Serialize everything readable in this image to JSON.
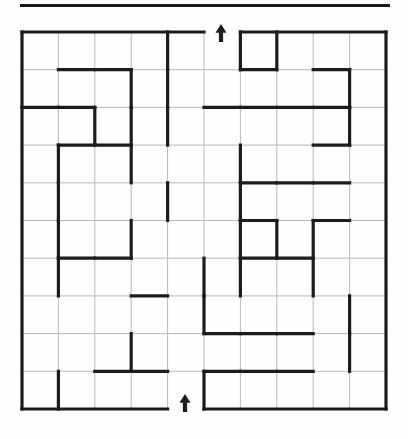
{
  "page": {
    "background_color": "#fefefe",
    "width": 408,
    "height": 439
  },
  "divider": {
    "name": "top-horizontal-rule",
    "color": "#1a1a1a",
    "x": 20,
    "y": 4,
    "width": 370,
    "thickness": 3
  },
  "maze": {
    "label": "10x10 rectangular maze",
    "columns": 10,
    "rows": 10,
    "origin_x": 22,
    "origin_y": 32,
    "cell_width": 36.4,
    "cell_height": 37.7,
    "grid_line_color": "#b9b9b9",
    "grid_line_width": 1,
    "wall_color": "#1c1c1c",
    "wall_width": 3.2,
    "entrance": {
      "name": "maze-entrance",
      "side": "top",
      "column": 5,
      "arrow_glyph": "up-arrow",
      "arrow_x": 221,
      "arrow_y": 24,
      "arrow_height": 18
    },
    "exit": {
      "name": "maze-exit",
      "side": "bottom",
      "column": 4,
      "arrow_glyph": "up-arrow",
      "arrow_x": 185,
      "arrow_y": 394,
      "arrow_height": 18
    },
    "border_segments": {
      "top": [
        [
          0,
          5
        ],
        [
          6,
          10
        ]
      ],
      "bottom": [
        [
          0,
          4
        ],
        [
          5,
          10
        ]
      ],
      "left": [
        [
          0,
          10
        ]
      ],
      "right": [
        [
          0,
          10
        ]
      ]
    },
    "horizontal_walls": [
      {
        "row": 1,
        "col": 1
      },
      {
        "row": 1,
        "col": 2
      },
      {
        "row": 1,
        "col": 8
      },
      {
        "row": 1,
        "col": 6
      },
      {
        "row": 2,
        "col": 0
      },
      {
        "row": 2,
        "col": 1
      },
      {
        "row": 2,
        "col": 5
      },
      {
        "row": 2,
        "col": 6
      },
      {
        "row": 2,
        "col": 7
      },
      {
        "row": 2,
        "col": 8
      },
      {
        "row": 3,
        "col": 1
      },
      {
        "row": 3,
        "col": 2
      },
      {
        "row": 3,
        "col": 8
      },
      {
        "row": 4,
        "col": 6
      },
      {
        "row": 4,
        "col": 7
      },
      {
        "row": 4,
        "col": 8
      },
      {
        "row": 5,
        "col": 6
      },
      {
        "row": 5,
        "col": 8
      },
      {
        "row": 6,
        "col": 1
      },
      {
        "row": 6,
        "col": 2
      },
      {
        "row": 6,
        "col": 6
      },
      {
        "row": 6,
        "col": 7
      },
      {
        "row": 7,
        "col": 3
      },
      {
        "row": 8,
        "col": 5
      },
      {
        "row": 8,
        "col": 6
      },
      {
        "row": 8,
        "col": 7
      },
      {
        "row": 9,
        "col": 2
      },
      {
        "row": 9,
        "col": 3
      },
      {
        "row": 9,
        "col": 5
      },
      {
        "row": 9,
        "col": 6
      },
      {
        "row": 9,
        "col": 7
      }
    ],
    "vertical_walls": [
      {
        "row": 0,
        "col": 4
      },
      {
        "row": 0,
        "col": 6
      },
      {
        "row": 0,
        "col": 7
      },
      {
        "row": 1,
        "col": 3
      },
      {
        "row": 1,
        "col": 4
      },
      {
        "row": 1,
        "col": 9
      },
      {
        "row": 2,
        "col": 2
      },
      {
        "row": 2,
        "col": 3
      },
      {
        "row": 2,
        "col": 4
      },
      {
        "row": 2,
        "col": 9
      },
      {
        "row": 3,
        "col": 1
      },
      {
        "row": 3,
        "col": 3
      },
      {
        "row": 3,
        "col": 6
      },
      {
        "row": 4,
        "col": 1
      },
      {
        "row": 4,
        "col": 4
      },
      {
        "row": 4,
        "col": 6
      },
      {
        "row": 5,
        "col": 1
      },
      {
        "row": 5,
        "col": 3
      },
      {
        "row": 5,
        "col": 6
      },
      {
        "row": 5,
        "col": 7
      },
      {
        "row": 5,
        "col": 8
      },
      {
        "row": 6,
        "col": 1
      },
      {
        "row": 6,
        "col": 5
      },
      {
        "row": 6,
        "col": 6
      },
      {
        "row": 6,
        "col": 8
      },
      {
        "row": 7,
        "col": 5
      },
      {
        "row": 7,
        "col": 9
      },
      {
        "row": 8,
        "col": 3
      },
      {
        "row": 8,
        "col": 9
      },
      {
        "row": 9,
        "col": 1
      },
      {
        "row": 9,
        "col": 5
      }
    ]
  }
}
